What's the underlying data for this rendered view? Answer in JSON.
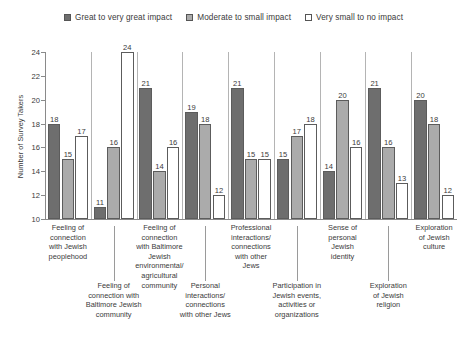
{
  "chart_data": {
    "type": "bar",
    "title": "",
    "xlabel": "",
    "ylabel": "Number of Survey Takers",
    "ylim": [
      10,
      24
    ],
    "yticks": [
      10,
      12,
      14,
      16,
      18,
      20,
      22,
      24
    ],
    "grid": false,
    "legend_position": "top-center",
    "categories": [
      "Feeling of connection with Jewish peoplehood",
      "Feeling of connection with Baltimore Jewish community",
      "Feeling of connection with Baltimore Jewish environmental/ agricultural community",
      "Personal interactions/ connections with other Jews",
      "Professional interactions/ connections with other Jews",
      "Participation in Jewish events, activities or organizations",
      "Sense of personal Jewish identity",
      "Exploration of Jewish religion",
      "Exploration of Jewish culture"
    ],
    "series": [
      {
        "name": "Great to very great impact",
        "color": "#6e6e6e",
        "values": [
          18,
          11,
          21,
          19,
          21,
          15,
          14,
          21,
          20
        ]
      },
      {
        "name": "Moderate to small impact",
        "color": "#ababab",
        "values": [
          15,
          16,
          14,
          18,
          15,
          17,
          20,
          16,
          18
        ]
      },
      {
        "name": "Very small to no impact",
        "color": "#ffffff",
        "values": [
          17,
          24,
          16,
          12,
          15,
          18,
          16,
          13,
          12
        ]
      }
    ]
  },
  "legend": {
    "items": [
      {
        "label": "Great to very great impact"
      },
      {
        "label": "Moderate to small impact"
      },
      {
        "label": "Very small to no impact"
      }
    ]
  },
  "axes": {
    "y_title": "Number of Survey Takers"
  },
  "category_lines": [
    [
      "Feeling of",
      "connection",
      "with Jewish",
      "peoplehood"
    ],
    [
      "Feeling of",
      "connection with",
      "Baltimore Jewish",
      "community"
    ],
    [
      "Feeling of",
      "connection",
      "with Baltimore",
      "Jewish",
      "environmental/",
      "agricultural",
      "community"
    ],
    [
      "Personal",
      "interactions/",
      "connections",
      "with other Jews"
    ],
    [
      "Professional",
      "interactions/",
      "connections",
      "with other",
      "Jews"
    ],
    [
      "Participation in",
      "Jewish events,",
      "activities or",
      "organizations"
    ],
    [
      "Sense of",
      "personal",
      "Jewish",
      "identity"
    ],
    [
      "Exploration",
      "of Jewish",
      "religion"
    ],
    [
      "Exploration",
      "of Jewish",
      "culture"
    ]
  ]
}
